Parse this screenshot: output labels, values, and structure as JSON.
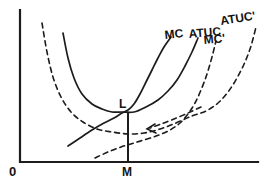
{
  "figure": {
    "origin_label": "0",
    "x_axis_point_label": "M",
    "optimum_point_label": "L",
    "curve_labels": {
      "mc": "MC",
      "atuc": "ATUC",
      "atuc_prime": "ATUC'",
      "mc_prime": "MC'"
    }
  },
  "colors": {
    "ink": "#1c1c1c",
    "background": "#ffffff"
  },
  "chart_data": {
    "type": "line",
    "title": "",
    "xlabel": "",
    "ylabel": "",
    "axes": {
      "x_origin_label": "0",
      "x_tick_labels": [
        "M"
      ],
      "numeric_scale": false,
      "grid": false
    },
    "annotations": [
      {
        "label": "L",
        "meaning": "minimum of ATUC where MC crosses",
        "at_px": [
          128,
          111
        ]
      },
      {
        "label": "M",
        "meaning": "output level below L on x-axis",
        "at_px": [
          128,
          162
        ]
      },
      {
        "label": "shift-arrow",
        "meaning": "dashed arrow pointing left toward LM line",
        "from_px": [
          201,
          107
        ],
        "to_px": [
          147,
          129
        ]
      }
    ],
    "coordinate_space": "screen pixels, y increases downward, canvas 265x186",
    "series": [
      {
        "name": "MC",
        "style": "solid",
        "points": [
          [
            68,
            146
          ],
          [
            80,
            138
          ],
          [
            92,
            130
          ],
          [
            104,
            123
          ],
          [
            114,
            118
          ],
          [
            122,
            113
          ],
          [
            128,
            110
          ],
          [
            134,
            104
          ],
          [
            140,
            94
          ],
          [
            146,
            82
          ],
          [
            152,
            70
          ],
          [
            158,
            58
          ],
          [
            164,
            47
          ],
          [
            171,
            37
          ]
        ]
      },
      {
        "name": "ATUC",
        "style": "solid",
        "points": [
          [
            63,
            33
          ],
          [
            68,
            58
          ],
          [
            74,
            78
          ],
          [
            82,
            94
          ],
          [
            92,
            104
          ],
          [
            102,
            109
          ],
          [
            112,
            112
          ],
          [
            122,
            112
          ],
          [
            134,
            112
          ],
          [
            146,
            107
          ],
          [
            158,
            100
          ],
          [
            168,
            91
          ],
          [
            177,
            80
          ],
          [
            185,
            66
          ],
          [
            192,
            52
          ],
          [
            198,
            38
          ]
        ]
      },
      {
        "name": "ATUC'",
        "style": "dashed",
        "points": [
          [
            42,
            23
          ],
          [
            47,
            52
          ],
          [
            53,
            77
          ],
          [
            61,
            97
          ],
          [
            71,
            112
          ],
          [
            83,
            122
          ],
          [
            97,
            129
          ],
          [
            112,
            132
          ],
          [
            128,
            134
          ],
          [
            144,
            133
          ],
          [
            160,
            129
          ],
          [
            176,
            123
          ],
          [
            192,
            116
          ],
          [
            206,
            111
          ],
          [
            218,
            103
          ],
          [
            228,
            92
          ],
          [
            237,
            78
          ],
          [
            245,
            62
          ],
          [
            251,
            46
          ],
          [
            256,
            27
          ]
        ]
      },
      {
        "name": "MC'",
        "style": "dashed",
        "points": [
          [
            95,
            158
          ],
          [
            108,
            152
          ],
          [
            121,
            147
          ],
          [
            134,
            143
          ],
          [
            147,
            139
          ],
          [
            159,
            135
          ],
          [
            170,
            130
          ],
          [
            180,
            123
          ],
          [
            188,
            114
          ],
          [
            195,
            103
          ],
          [
            201,
            90
          ],
          [
            207,
            74
          ],
          [
            212,
            57
          ],
          [
            216,
            41
          ]
        ]
      },
      {
        "name": "shift-arrow",
        "style": "dashed",
        "points": [
          [
            201,
            107
          ],
          [
            188,
            113
          ],
          [
            174,
            119
          ],
          [
            161,
            124
          ],
          [
            150,
            128
          ]
        ]
      }
    ],
    "vertical_line_px": {
      "x": 128,
      "y_top": 112,
      "y_bottom": 162
    },
    "axes_px": {
      "y_axis": [
        [
          20,
          10
        ],
        [
          20,
          162
        ]
      ],
      "x_axis": [
        [
          20,
          162
        ],
        [
          258,
          162
        ]
      ]
    }
  }
}
